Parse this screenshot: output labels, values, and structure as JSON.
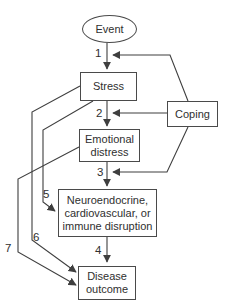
{
  "diagram": {
    "colors": {
      "background": "#ffffff",
      "line": "#3f3f3f",
      "text": "#2f2f2f"
    },
    "nodes": {
      "event": {
        "label": "Event",
        "shape": "ellipse"
      },
      "stress": {
        "label": "Stress",
        "shape": "rect"
      },
      "coping": {
        "label": "Coping",
        "shape": "rect"
      },
      "emotional_distress": {
        "lines": [
          "Emotional",
          "distress"
        ],
        "shape": "rect"
      },
      "physiological_disruption": {
        "lines": [
          "Neuroendocrine,",
          "cardiovascular, or",
          "immune disruption"
        ],
        "shape": "rect"
      },
      "disease_outcome": {
        "lines": [
          "Disease",
          "outcome"
        ],
        "shape": "rect"
      }
    },
    "edges": [
      {
        "label": "1",
        "from": "event",
        "to": "stress"
      },
      {
        "label": "2",
        "from": "stress",
        "to": "emotional_distress"
      },
      {
        "label": "3",
        "from": "emotional_distress",
        "to": "physiological_disruption"
      },
      {
        "label": "4",
        "from": "physiological_disruption",
        "to": "disease_outcome"
      },
      {
        "label": "5",
        "from": "stress",
        "to": "physiological_disruption"
      },
      {
        "label": "6",
        "from": "stress",
        "to": "disease_outcome"
      },
      {
        "label": "7",
        "from": "emotional_distress",
        "to": "disease_outcome"
      },
      {
        "label": "",
        "from": "coping",
        "to": "edge-1"
      },
      {
        "label": "",
        "from": "coping",
        "to": "edge-2"
      },
      {
        "label": "",
        "from": "coping",
        "to": "edge-3"
      }
    ]
  }
}
